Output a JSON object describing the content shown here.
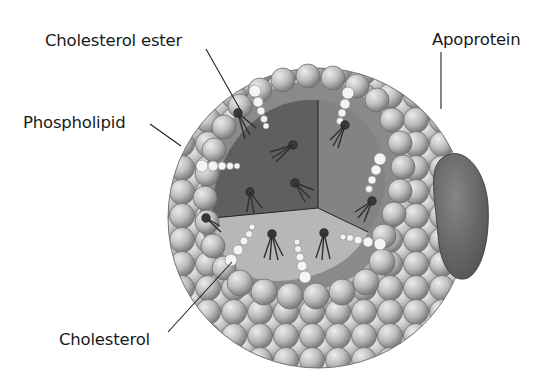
{
  "diagram": {
    "labels": {
      "cholesterol_ester": "Cholesterol ester",
      "phospholipid": "Phospholipid",
      "apoprotein": "Apoprotein",
      "cholesterol": "Cholesterol"
    },
    "colors": {
      "background": "#ffffff",
      "sphere_light": "#d8d8d8",
      "sphere_mid": "#a8a8a8",
      "sphere_edge": "#6e6e6e",
      "core_dark": "#6a6a6a",
      "core_mid": "#8a8a8a",
      "core_floor": "#b9b9b9",
      "apoprotein": "#6b6b6b",
      "cholesterol_bead": "#f4f4f4",
      "leader_line": "#222222",
      "text": "#1a1a1a"
    }
  }
}
